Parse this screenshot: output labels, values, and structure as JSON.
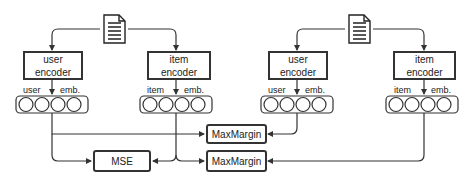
{
  "diagram": {
    "left_group": {
      "document_icon": "document-icon",
      "user_encoder": {
        "line1": "user",
        "line2": "encoder"
      },
      "item_encoder": {
        "line1": "item",
        "line2": "encoder"
      },
      "user_embedding": {
        "label_left": "user",
        "label_right": "emb.",
        "circles": 4
      },
      "item_embedding": {
        "label_left": "item",
        "label_right": "emb.",
        "circles": 4
      }
    },
    "right_group": {
      "document_icon": "document-icon",
      "user_encoder": {
        "line1": "user",
        "line2": "encoder"
      },
      "item_encoder": {
        "line1": "item",
        "line2": "encoder"
      },
      "user_embedding": {
        "label_left": "user",
        "label_right": "emb.",
        "circles": 4
      },
      "item_embedding": {
        "label_left": "item",
        "label_right": "emb.",
        "circles": 4
      }
    },
    "losses": {
      "mse": "MSE",
      "maxmargin_top": "MaxMargin",
      "maxmargin_bottom": "MaxMargin"
    },
    "colors": {
      "stroke": "#333333",
      "background": "#ffffff"
    }
  }
}
